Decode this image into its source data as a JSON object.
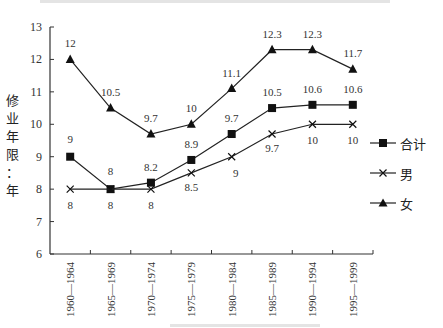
{
  "chart_data": {
    "type": "line",
    "title": "",
    "xlabel": "",
    "ylabel": "修业年限：年",
    "ylim": [
      6,
      13
    ],
    "yticks": [
      6,
      7,
      8,
      9,
      10,
      11,
      12,
      13
    ],
    "grid": false,
    "legend_position": "right",
    "categories": [
      "1960—1964",
      "1965—1969",
      "1970—1974",
      "1975—1979",
      "1980—1984",
      "1985—1989",
      "1990—1994",
      "1995—1999"
    ],
    "series": [
      {
        "name": "合计",
        "marker": "square",
        "values": [
          9,
          8,
          8.2,
          8.9,
          9.7,
          10.5,
          10.6,
          10.6
        ]
      },
      {
        "name": "男",
        "marker": "x",
        "values": [
          8,
          8,
          8,
          8.5,
          9,
          9.7,
          10,
          10
        ]
      },
      {
        "name": "女",
        "marker": "triangle",
        "values": [
          12,
          10.5,
          9.7,
          10,
          11.1,
          12.3,
          12.3,
          11.7
        ]
      }
    ]
  },
  "ylabel_chars": [
    "修",
    "业",
    "年",
    "限",
    "：",
    "年"
  ],
  "legend": [
    "合计",
    "男",
    "女"
  ]
}
